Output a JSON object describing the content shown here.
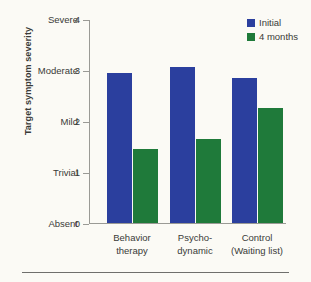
{
  "chart_data": {
    "type": "bar",
    "title": "",
    "xlabel": "",
    "ylabel": "Target symptom severity",
    "ylim": [
      0,
      4
    ],
    "grid": false,
    "legend_position": "top-right",
    "categories": [
      "Behavior therapy",
      "Psycho-dynamic",
      "Control (Waiting list)"
    ],
    "category_lines": [
      [
        "Behavior",
        "therapy"
      ],
      [
        "Psycho-",
        "dynamic"
      ],
      [
        "Control",
        "(Waiting list)"
      ]
    ],
    "series": [
      {
        "name": "Initial",
        "color": "#2b3f9e",
        "values": [
          2.95,
          3.05,
          2.85
        ]
      },
      {
        "name": "4 months",
        "color": "#1f7a3a",
        "values": [
          1.45,
          1.65,
          2.25
        ]
      }
    ],
    "y_ticks": [
      {
        "value": 0,
        "number": "0",
        "label": "Absent"
      },
      {
        "value": 1,
        "number": "1",
        "label": "Trivial"
      },
      {
        "value": 2,
        "number": "2",
        "label": "Mild"
      },
      {
        "value": 3,
        "number": "3",
        "label": "Moderate"
      },
      {
        "value": 4,
        "number": "4",
        "label": "Severe"
      }
    ]
  }
}
